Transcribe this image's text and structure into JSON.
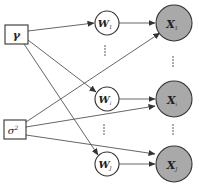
{
  "diagram": {
    "type": "graphical-model",
    "colors": {
      "background": "#ffffff",
      "stroke": "#333333",
      "edge": "#555555",
      "observed_fill": "#a9a9a9",
      "latent_fill": "#ffffff"
    },
    "hyperparameters": [
      {
        "id": "gamma",
        "label": "γ",
        "shape": "box"
      },
      {
        "id": "sigma2",
        "label": "σ",
        "superscript": "2",
        "shape": "box"
      }
    ],
    "latent_nodes": [
      {
        "id": "W1",
        "label": "W",
        "subscript": "1"
      },
      {
        "id": "Wi",
        "label": "W",
        "subscript": "i"
      },
      {
        "id": "WJ",
        "label": "W",
        "subscript": "J"
      }
    ],
    "observed_nodes": [
      {
        "id": "X1",
        "label": "X",
        "subscript": "1"
      },
      {
        "id": "Xi",
        "label": "X",
        "subscript": "i"
      },
      {
        "id": "XJ",
        "label": "X",
        "subscript": "J"
      }
    ],
    "ellipsis": "⋮",
    "edges": [
      {
        "from": "gamma",
        "to": "W1"
      },
      {
        "from": "gamma",
        "to": "Wi"
      },
      {
        "from": "gamma",
        "to": "WJ"
      },
      {
        "from": "sigma2",
        "to": "X1"
      },
      {
        "from": "sigma2",
        "to": "Xi"
      },
      {
        "from": "sigma2",
        "to": "XJ"
      },
      {
        "from": "W1",
        "to": "X1"
      },
      {
        "from": "Wi",
        "to": "Xi"
      },
      {
        "from": "WJ",
        "to": "XJ"
      }
    ]
  }
}
